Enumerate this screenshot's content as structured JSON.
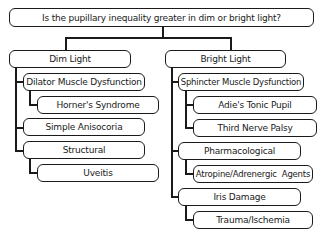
{
  "question": "Is the pupillary inequality greater in dim or bright light?",
  "dim_light": {
    "label": "Dim Light",
    "children": [
      {
        "label": "Dilator Muscle Dysfunction",
        "children": [
          {
            "label": "Horner's Syndrome"
          }
        ]
      },
      {
        "label": "Simple Anisocoria"
      },
      {
        "label": "Structural",
        "children": [
          {
            "label": "Uveitis"
          }
        ]
      }
    ]
  },
  "bright_light": {
    "label": "Bright Light",
    "children": [
      {
        "label": "Sphincter Muscle Dysfunction",
        "children": [
          {
            "label": "Adie's Tonic Pupil"
          },
          {
            "label": "Third Nerve Palsy"
          }
        ]
      },
      {
        "label": "Pharmacological",
        "children": [
          {
            "label": "Atropine/Adrenergic  Agents"
          }
        ]
      },
      {
        "label": "Iris Damage",
        "children": [
          {
            "label": "Trauma/Ischemia"
          }
        ]
      }
    ]
  }
}
